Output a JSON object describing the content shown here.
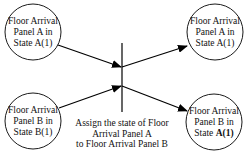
{
  "diagram": {
    "type": "petri-net-transition",
    "places": [
      {
        "id": "p1",
        "lines": [
          "Floor Arrival",
          "Panel A in",
          "State A(1)"
        ]
      },
      {
        "id": "p2",
        "lines": [
          "Floor Arrival",
          "Panel A in",
          "State A(1)"
        ]
      },
      {
        "id": "p3",
        "lines": [
          "Floor Arrival",
          "Panel B in",
          "State B(1)"
        ]
      },
      {
        "id": "p4",
        "lines": [
          "Floor Arrival",
          "Panel B in",
          "State "
        ],
        "bold_suffix": "A(1)"
      }
    ],
    "transition": {
      "caption_lines": [
        "Assign the state of Floor",
        "Arrival Panel A",
        "to Floor Arrival Panel B"
      ]
    },
    "arcs": [
      {
        "from": "p1",
        "to": "transition"
      },
      {
        "from": "p3",
        "to": "transition"
      },
      {
        "from": "transition",
        "to": "p2"
      },
      {
        "from": "transition",
        "to": "p4"
      }
    ],
    "colors": {
      "stroke": "#000000",
      "background": "#ffffff"
    }
  }
}
